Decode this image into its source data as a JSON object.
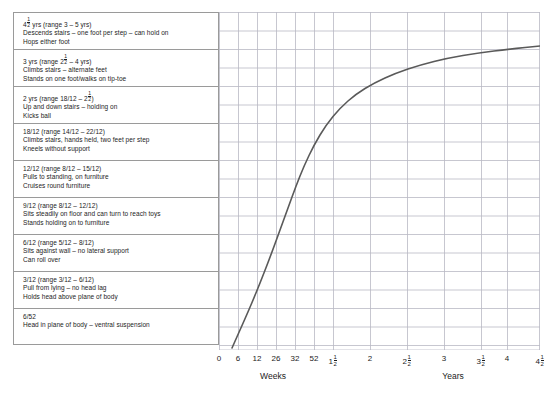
{
  "chart_data": {
    "type": "line",
    "xlabel_left": "Weeks",
    "xlabel_right": "Years",
    "ylabel": "",
    "grid": true,
    "legend": "none",
    "x_tick_labels": [
      "0",
      "6",
      "12",
      "26",
      "32",
      "52",
      "1 1/2",
      "2",
      "2 1/2",
      "3",
      "3 1/2",
      "4",
      "4 1/2"
    ],
    "x_tick_units": [
      "weeks",
      "weeks",
      "weeks",
      "weeks",
      "weeks",
      "weeks",
      "years",
      "years",
      "years",
      "years",
      "years",
      "years",
      "years"
    ],
    "x_tick_px": [
      219,
      238,
      257,
      276,
      295,
      314,
      333,
      370,
      407,
      444,
      481,
      507,
      540
    ],
    "curve_points_px": [
      [
        232,
        348
      ],
      [
        240,
        330
      ],
      [
        248,
        312
      ],
      [
        256,
        293
      ],
      [
        264,
        273
      ],
      [
        272,
        252
      ],
      [
        280,
        230
      ],
      [
        288,
        208
      ],
      [
        296,
        186
      ],
      [
        304,
        166
      ],
      [
        314,
        145
      ],
      [
        326,
        125
      ],
      [
        340,
        108
      ],
      [
        356,
        94
      ],
      [
        374,
        83
      ],
      [
        396,
        73
      ],
      [
        420,
        65
      ],
      [
        448,
        58
      ],
      [
        478,
        53
      ],
      [
        510,
        49
      ],
      [
        540,
        46
      ]
    ],
    "curve_color": "#5a5a5a",
    "curve_width": 1.6,
    "note": "Sigmoid curve of motor development plotted against age; y-axis unlabelled, rows align with milestone bands"
  },
  "panel": {
    "rows": [
      {
        "age_label": "4",
        "age_frac_num": "1",
        "age_frac_den": "2",
        "age_suffix": " yrs (range 3 – 5 yrs)",
        "line2": "Descends stairs – one foot per step – can hold on",
        "line3": "Hops either foot"
      },
      {
        "age_label": "3 yrs (range 2",
        "age_frac_num": "1",
        "age_frac_den": "2",
        "age_suffix": " – 4 yrs)",
        "line2": "Climbs stairs – alternate feet",
        "line3": "Stands on one foot/walks on tip-toe"
      },
      {
        "age_label": "2 yrs (range 18/12 – 2",
        "age_frac_num": "1",
        "age_frac_den": "2",
        "age_suffix": ")",
        "line2": "Up and down stairs – holding on",
        "line3": "Kicks ball"
      },
      {
        "age_label": "18/12 (range 14/12 – 22/12)",
        "age_frac_num": "",
        "age_frac_den": "",
        "age_suffix": "",
        "line2": "Climbs stairs, hands held, two feet per step",
        "line3": "Kneels without support"
      },
      {
        "age_label": "12/12 (range 8/12 – 15/12)",
        "age_frac_num": "",
        "age_frac_den": "",
        "age_suffix": "",
        "line2": "Pulls to standing, on furniture",
        "line3": "Cruises round furniture"
      },
      {
        "age_label": "9/12 (range 8/12 – 12/12)",
        "age_frac_num": "",
        "age_frac_den": "",
        "age_suffix": "",
        "line2": "Sits steadily on floor and can turn to reach toys",
        "line3": "Stands holding on to furniture"
      },
      {
        "age_label": "6/12 (range 5/12 – 8/12)",
        "age_frac_num": "",
        "age_frac_den": "",
        "age_suffix": "",
        "line2": "Sits against wall – no lateral support",
        "line3": "Can roll over"
      },
      {
        "age_label": "3/12 (range 3/12 – 6/12)",
        "age_frac_num": "",
        "age_frac_den": "",
        "age_suffix": "",
        "line2": "Pull from lying – no head lag",
        "line3": "Holds head above plane of body"
      },
      {
        "age_label": "6/52",
        "age_frac_num": "",
        "age_frac_den": "",
        "age_suffix": "",
        "line2": "Head in plane of body – ventral suspension",
        "line3": ""
      }
    ]
  },
  "axis": {
    "ticks": [
      {
        "label": "0",
        "frac_num": "",
        "frac_den": ""
      },
      {
        "label": "6",
        "frac_num": "",
        "frac_den": ""
      },
      {
        "label": "12",
        "frac_num": "",
        "frac_den": ""
      },
      {
        "label": "26",
        "frac_num": "",
        "frac_den": ""
      },
      {
        "label": "32",
        "frac_num": "",
        "frac_den": ""
      },
      {
        "label": "52",
        "frac_num": "",
        "frac_den": ""
      },
      {
        "label": "1",
        "frac_num": "1",
        "frac_den": "2"
      },
      {
        "label": "2",
        "frac_num": "",
        "frac_den": ""
      },
      {
        "label": "2",
        "frac_num": "1",
        "frac_den": "2"
      },
      {
        "label": "3",
        "frac_num": "",
        "frac_den": ""
      },
      {
        "label": "3",
        "frac_num": "1",
        "frac_den": "2"
      },
      {
        "label": "4",
        "frac_num": "",
        "frac_den": ""
      },
      {
        "label": "4",
        "frac_num": "1",
        "frac_den": "2"
      }
    ],
    "weeks_label": "Weeks",
    "years_label": "Years"
  },
  "colors": {
    "grid": "#b9b9c4",
    "border": "#9a9a9a",
    "curve": "#5a5a5a",
    "text": "#1c1c1c",
    "background": "#ffffff"
  }
}
